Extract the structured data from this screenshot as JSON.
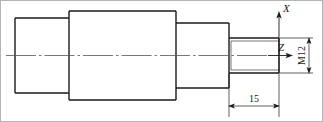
{
  "drawing": {
    "type": "mechanical-part-drawing",
    "subject": "stepped shaft with threaded end",
    "border_color": "#b4b4b4",
    "line_color": "#1a1a1a",
    "centerline_color": "#555555",
    "background": "#ffffff",
    "axes": {
      "x_label": "X",
      "z_label": "Z",
      "origin_note": "axis origin at right end face of thread, on shaft centerline"
    },
    "dimensions": [
      {
        "name": "thread-length",
        "value": "15",
        "orientation": "horizontal",
        "placement": "below",
        "arrows": "both-ends"
      },
      {
        "name": "thread-designation",
        "value": "M12",
        "orientation": "vertical",
        "placement": "right",
        "arrows": "both-ends"
      }
    ],
    "features": [
      {
        "name": "left-journal",
        "kind": "cylinder"
      },
      {
        "name": "main-body",
        "kind": "cylinder"
      },
      {
        "name": "right-journal",
        "kind": "cylinder"
      },
      {
        "name": "threaded-end",
        "kind": "external-thread"
      }
    ]
  }
}
